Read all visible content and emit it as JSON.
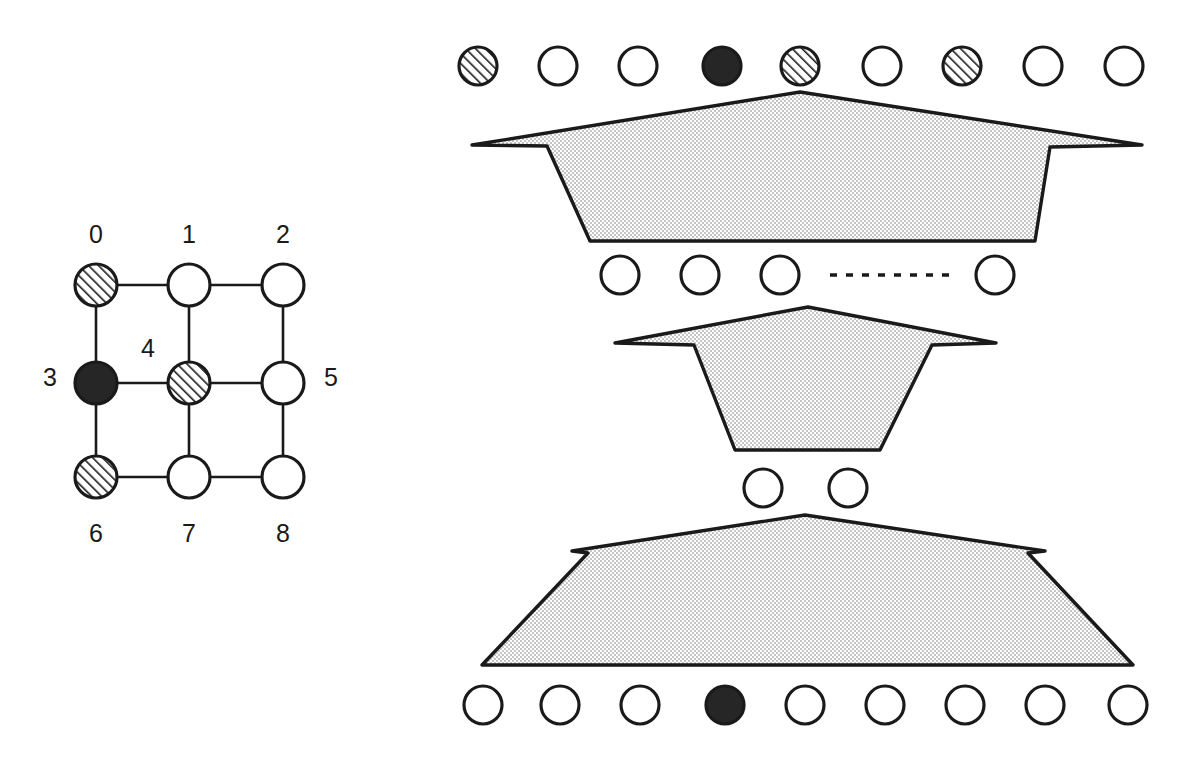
{
  "figure": {
    "background_color": "#ffffff",
    "stroke_color": "#1a1a1a",
    "fill_white": "#ffffff",
    "fill_black": "#262626",
    "fill_shaded": "#ededed",
    "hatch_color": "#1a1a1a"
  },
  "grid_panel": {
    "name": "3x3 neighborhood grid",
    "columns_x": [
      96,
      189,
      283
    ],
    "rows_y": [
      285,
      383,
      477
    ],
    "node_radius": 21,
    "cells": [
      {
        "index": "0",
        "fill": "hatched",
        "label": "0",
        "label_x": 96,
        "label_y": 236,
        "label_pos": "above"
      },
      {
        "index": "1",
        "fill": "white",
        "label": "1",
        "label_x": 189,
        "label_y": 236,
        "label_pos": "above"
      },
      {
        "index": "2",
        "fill": "white",
        "label": "2",
        "label_x": 283,
        "label_y": 236,
        "label_pos": "above"
      },
      {
        "index": "3",
        "fill": "black",
        "label": "3",
        "label_x": 50,
        "label_y": 379,
        "label_pos": "left"
      },
      {
        "index": "4",
        "fill": "hatched",
        "label": "4",
        "label_x": 148,
        "label_y": 350,
        "label_pos": "upper-left-inset"
      },
      {
        "index": "5",
        "fill": "white",
        "label": "5",
        "label_x": 331,
        "label_y": 379,
        "label_pos": "right"
      },
      {
        "index": "6",
        "fill": "hatched",
        "label": "6",
        "label_x": 96,
        "label_y": 535,
        "label_pos": "below"
      },
      {
        "index": "7",
        "fill": "white",
        "label": "7",
        "label_x": 189,
        "label_y": 535,
        "label_pos": "below"
      },
      {
        "index": "8",
        "fill": "white",
        "label": "8",
        "label_x": 283,
        "label_y": 535,
        "label_pos": "below"
      }
    ],
    "edges": [
      {
        "from": "0",
        "to": "1"
      },
      {
        "from": "1",
        "to": "2"
      },
      {
        "from": "3",
        "to": "4"
      },
      {
        "from": "4",
        "to": "5"
      },
      {
        "from": "6",
        "to": "7"
      },
      {
        "from": "7",
        "to": "8"
      },
      {
        "from": "0",
        "to": "3"
      },
      {
        "from": "3",
        "to": "6"
      },
      {
        "from": "1",
        "to": "4"
      },
      {
        "from": "4",
        "to": "7"
      },
      {
        "from": "2",
        "to": "5"
      },
      {
        "from": "5",
        "to": "8"
      }
    ]
  },
  "network_panel": {
    "name": "Layered funnel network",
    "node_radius": 19,
    "layers": [
      {
        "id": "layer-1-top",
        "y": 66,
        "node_count": 9,
        "nodes": [
          {
            "x": 478,
            "fill": "hatched"
          },
          {
            "x": 558,
            "fill": "white"
          },
          {
            "x": 638,
            "fill": "white"
          },
          {
            "x": 722,
            "fill": "black"
          },
          {
            "x": 800,
            "fill": "hatched"
          },
          {
            "x": 882,
            "fill": "white"
          },
          {
            "x": 962,
            "fill": "hatched"
          },
          {
            "x": 1043,
            "fill": "white"
          },
          {
            "x": 1124,
            "fill": "white"
          }
        ],
        "dashed_gap": null
      },
      {
        "id": "layer-2",
        "y": 275,
        "node_count": 4,
        "nodes": [
          {
            "x": 620,
            "fill": "white"
          },
          {
            "x": 700,
            "fill": "white"
          },
          {
            "x": 780,
            "fill": "white"
          },
          {
            "x": 995,
            "fill": "white"
          }
        ],
        "dashed_gap": {
          "x1": 830,
          "x2": 955,
          "y": 275,
          "dash": "7 9"
        }
      },
      {
        "id": "layer-3",
        "y": 488,
        "node_count": 2,
        "nodes": [
          {
            "x": 763,
            "fill": "white"
          },
          {
            "x": 848,
            "fill": "white"
          }
        ],
        "dashed_gap": null
      },
      {
        "id": "layer-4-bottom",
        "y": 705,
        "node_count": 9,
        "nodes": [
          {
            "x": 483,
            "fill": "white"
          },
          {
            "x": 560,
            "fill": "white"
          },
          {
            "x": 640,
            "fill": "white"
          },
          {
            "x": 725,
            "fill": "black"
          },
          {
            "x": 805,
            "fill": "white"
          },
          {
            "x": 885,
            "fill": "white"
          },
          {
            "x": 965,
            "fill": "white"
          },
          {
            "x": 1045,
            "fill": "white"
          },
          {
            "x": 1128,
            "fill": "white"
          }
        ],
        "dashed_gap": null
      }
    ],
    "funnels": [
      {
        "id": "funnel-1",
        "orientation": "converging-down",
        "points": "800,92 1142,145 1050,147 1035,241 590,241 547,146 472,145"
      },
      {
        "id": "funnel-2",
        "orientation": "converging-down",
        "points": "808,307 996,343 932,345 880,450 735,450 694,345 615,343"
      },
      {
        "id": "funnel-3",
        "orientation": "diverging-down",
        "points": "805,515 1045,551 1028,553 1133,665 482,665 588,553 572,551"
      }
    ]
  }
}
